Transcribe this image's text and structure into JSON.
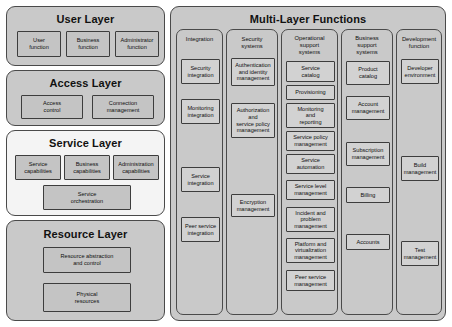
{
  "diagram": {
    "left_column": {
      "layers": [
        {
          "name": "user-layer",
          "title": "User Layer",
          "items": [
            "User\nfunction",
            "Business\nfunction",
            "Administrator\nfunction"
          ]
        },
        {
          "name": "access-layer",
          "title": "Access Layer",
          "items": [
            "Access\ncontrol",
            "Connection\nmanagement"
          ]
        },
        {
          "name": "service-layer",
          "title": "Service Layer",
          "items": [
            "Service\ncapabilities",
            "Business\ncapabilities",
            "Administration\ncapabilities",
            "Service\norchestration"
          ]
        },
        {
          "name": "resource-layer",
          "title": "Resource Layer",
          "items": [
            "Resource abstraction\nand control",
            "Physical\nresources"
          ]
        }
      ]
    },
    "multi_layer_functions": {
      "title": "Multi-Layer Functions",
      "columns": [
        {
          "header": "Integration",
          "items": [
            "Security\nintegration",
            "Monitoring\nintegration",
            "Service\nintegration",
            "Peer service\nintegration"
          ]
        },
        {
          "header": "Security\nsystems",
          "items": [
            "Authentication\nand identity\nmanagement",
            "Authorization\nand\nservice policy\nmanagement",
            "Encryption\nmanagement"
          ]
        },
        {
          "header": "Operational\nsupport\nsystems",
          "items": [
            "Service\ncatalog",
            "Provisioning",
            "Monitoring\nand\nreporting",
            "Service policy\nmanagement",
            "Service\nautomation",
            "Service level\nmanagement",
            "Incident and\nproblem\nmanagement",
            "Platform and\nvirtualization\nmanagement",
            "Peer service\nmanagement"
          ]
        },
        {
          "header": "Business\nsupport\nsystems",
          "items": [
            "Product\ncatalog",
            "Account\nmanagement",
            "Subscription\nmanagement",
            "Billing",
            "Accounts"
          ]
        },
        {
          "header": "Development\nfunction",
          "items": [
            "Developer\nenvironment",
            "Build\nmanagement",
            "Test\nmanagement"
          ]
        }
      ]
    }
  }
}
